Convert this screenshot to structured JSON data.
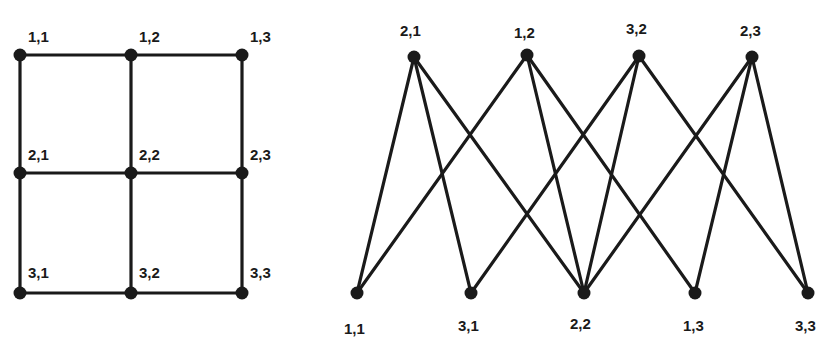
{
  "grid_graph": {
    "nodes": [
      {
        "id": "1,1",
        "label": "1,1",
        "x": 20,
        "y": 55,
        "lx": 28,
        "ly": 42
      },
      {
        "id": "1,2",
        "label": "1,2",
        "x": 131,
        "y": 55,
        "lx": 139,
        "ly": 42
      },
      {
        "id": "1,3",
        "label": "1,3",
        "x": 242,
        "y": 55,
        "lx": 250,
        "ly": 42
      },
      {
        "id": "2,1",
        "label": "2,1",
        "x": 20,
        "y": 173,
        "lx": 28,
        "ly": 160
      },
      {
        "id": "2,2",
        "label": "2,2",
        "x": 131,
        "y": 173,
        "lx": 139,
        "ly": 160
      },
      {
        "id": "2,3",
        "label": "2,3",
        "x": 242,
        "y": 173,
        "lx": 250,
        "ly": 160
      },
      {
        "id": "3,1",
        "label": "3,1",
        "x": 20,
        "y": 293,
        "lx": 28,
        "ly": 278
      },
      {
        "id": "3,2",
        "label": "3,2",
        "x": 131,
        "y": 293,
        "lx": 139,
        "ly": 278
      },
      {
        "id": "3,3",
        "label": "3,3",
        "x": 242,
        "y": 293,
        "lx": 250,
        "ly": 278
      }
    ],
    "edges": [
      [
        "1,1",
        "1,2"
      ],
      [
        "1,2",
        "1,3"
      ],
      [
        "2,1",
        "2,2"
      ],
      [
        "2,2",
        "2,3"
      ],
      [
        "3,1",
        "3,2"
      ],
      [
        "3,2",
        "3,3"
      ],
      [
        "1,1",
        "2,1"
      ],
      [
        "2,1",
        "3,1"
      ],
      [
        "1,2",
        "2,2"
      ],
      [
        "2,2",
        "3,2"
      ],
      [
        "1,3",
        "2,3"
      ],
      [
        "2,3",
        "3,3"
      ]
    ]
  },
  "bipartite_graph": {
    "top_nodes": [
      {
        "id": "2,1",
        "label": "2,1",
        "x": 414,
        "y": 57,
        "lx": 400,
        "ly": 36
      },
      {
        "id": "1,2",
        "label": "1,2",
        "x": 527,
        "y": 55,
        "lx": 514,
        "ly": 38
      },
      {
        "id": "3,2",
        "label": "3,2",
        "x": 639,
        "y": 56,
        "lx": 626,
        "ly": 34
      },
      {
        "id": "2,3",
        "label": "2,3",
        "x": 752,
        "y": 57,
        "lx": 740,
        "ly": 36
      }
    ],
    "bottom_nodes": [
      {
        "id": "1,1",
        "label": "1,1",
        "x": 357,
        "y": 293,
        "lx": 344,
        "ly": 334
      },
      {
        "id": "3,1",
        "label": "3,1",
        "x": 471,
        "y": 293,
        "lx": 458,
        "ly": 331
      },
      {
        "id": "2,2",
        "label": "2,2",
        "x": 584,
        "y": 293,
        "lx": 570,
        "ly": 329
      },
      {
        "id": "1,3",
        "label": "1,3",
        "x": 695,
        "y": 293,
        "lx": 683,
        "ly": 331
      },
      {
        "id": "3,3",
        "label": "3,3",
        "x": 808,
        "y": 293,
        "lx": 795,
        "ly": 331
      }
    ],
    "edges": [
      [
        "2,1",
        "1,1"
      ],
      [
        "2,1",
        "3,1"
      ],
      [
        "2,1",
        "2,2"
      ],
      [
        "1,2",
        "1,1"
      ],
      [
        "1,2",
        "2,2"
      ],
      [
        "1,2",
        "1,3"
      ],
      [
        "3,2",
        "3,1"
      ],
      [
        "3,2",
        "2,2"
      ],
      [
        "3,2",
        "3,3"
      ],
      [
        "2,3",
        "2,2"
      ],
      [
        "2,3",
        "1,3"
      ],
      [
        "2,3",
        "3,3"
      ]
    ]
  },
  "colors": {
    "ink": "#1a1a1a",
    "background": "#ffffff"
  }
}
